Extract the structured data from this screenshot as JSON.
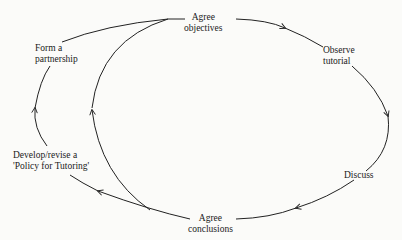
{
  "diagram": {
    "type": "cycle",
    "nodes": [
      {
        "id": "agree-objectives",
        "lines": [
          "Agree",
          "objectives"
        ]
      },
      {
        "id": "observe-tutorial",
        "lines": [
          "Observe",
          "tutorial"
        ]
      },
      {
        "id": "discuss",
        "lines": [
          "Discuss"
        ]
      },
      {
        "id": "agree-conclusions",
        "lines": [
          "Agree",
          "conclusions"
        ]
      },
      {
        "id": "develop-policy",
        "lines": [
          "Develop/revise a",
          "'Policy for Tutoring'"
        ]
      },
      {
        "id": "form-partnership",
        "lines": [
          "Form a",
          "partnership"
        ]
      }
    ],
    "edges": [
      {
        "from": "agree-objectives",
        "to": "observe-tutorial"
      },
      {
        "from": "observe-tutorial",
        "to": "discuss"
      },
      {
        "from": "discuss",
        "to": "agree-conclusions"
      },
      {
        "from": "agree-conclusions",
        "to": "agree-objectives",
        "note": "inner loop"
      },
      {
        "from": "agree-conclusions",
        "to": "develop-policy"
      },
      {
        "from": "develop-policy",
        "to": "form-partnership"
      },
      {
        "from": "form-partnership",
        "to": "agree-objectives"
      }
    ],
    "colors": {
      "line": "#222222",
      "text": "#1a1a1a",
      "background": "#fbfbf9"
    }
  }
}
